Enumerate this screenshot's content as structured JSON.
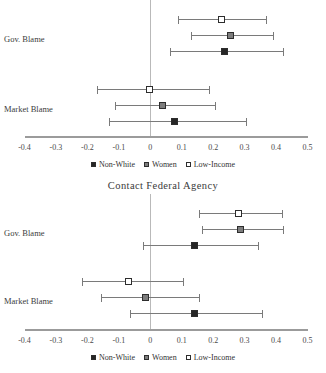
{
  "figure": {
    "axis": {
      "ticks": [
        "-0.4",
        "-0.3",
        "-0.2",
        "-0.1",
        "0",
        "0.1",
        "0.2",
        "0.3",
        "0.4",
        "0.5"
      ],
      "xmin": -0.4,
      "xmax": 0.5
    },
    "legend": [
      {
        "label": "Non-White",
        "swatch": "filled-black-square",
        "color": "#262626"
      },
      {
        "label": "Women",
        "swatch": "filled-gray-square",
        "color": "#7d7d7d"
      },
      {
        "label": "Low-Income",
        "swatch": "open-white-square",
        "color": "#ffffff"
      }
    ],
    "group_labels": [
      "Gov. Blame",
      "Market Blame"
    ]
  },
  "chart_data": [
    {
      "type": "scatter",
      "title": "",
      "panel": "top",
      "xlabel": "",
      "ylabel": "",
      "xlim": [
        -0.4,
        0.5
      ],
      "grid": false,
      "reference_line": 0,
      "legend_position": "bottom",
      "categories": [
        "Gov. Blame",
        "Market Blame"
      ],
      "series": [
        {
          "name": "Low-Income",
          "estimates": [
            0.23,
            0.0
          ],
          "ci_low": [
            0.089,
            -0.168
          ],
          "ci_high": [
            0.368,
            0.187
          ]
        },
        {
          "name": "Women",
          "estimates": [
            0.257,
            0.043
          ],
          "ci_low": [
            0.128,
            -0.112
          ],
          "ci_high": [
            0.391,
            0.207
          ]
        },
        {
          "name": "Non-White",
          "estimates": [
            0.24,
            0.079
          ],
          "ci_low": [
            0.063,
            -0.132
          ],
          "ci_high": [
            0.421,
            0.303
          ]
        }
      ]
    },
    {
      "type": "scatter",
      "title": "Contact Federal Agency",
      "panel": "bottom",
      "xlabel": "",
      "ylabel": "",
      "xlim": [
        -0.4,
        0.5
      ],
      "grid": false,
      "reference_line": 0,
      "legend_position": "bottom",
      "categories": [
        "Gov. Blame",
        "Market Blame"
      ],
      "series": [
        {
          "name": "Low-Income",
          "estimates": [
            0.283,
            -0.066
          ],
          "ci_low": [
            0.155,
            -0.217
          ],
          "ci_high": [
            0.418,
            0.105
          ]
        },
        {
          "name": "Women",
          "estimates": [
            0.289,
            -0.013
          ],
          "ci_low": [
            0.164,
            -0.158
          ],
          "ci_high": [
            0.421,
            0.155
          ]
        },
        {
          "name": "Non-White",
          "estimates": [
            0.145,
            0.145
          ],
          "ci_low": [
            -0.023,
            -0.066
          ],
          "ci_high": [
            0.342,
            0.355
          ]
        }
      ]
    }
  ]
}
